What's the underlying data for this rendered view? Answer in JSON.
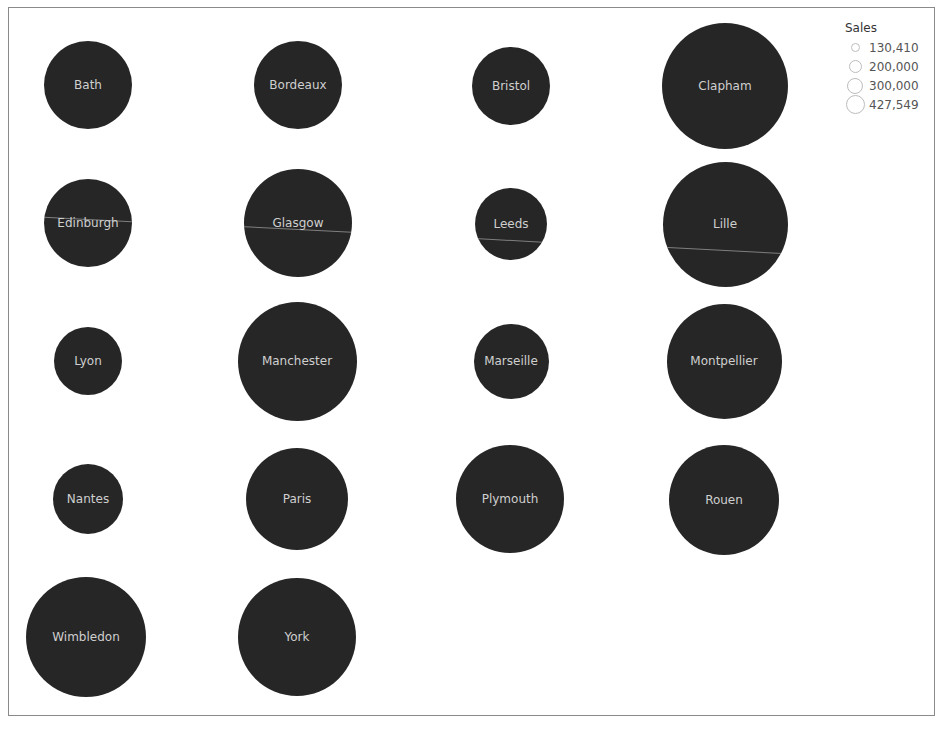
{
  "chart_data": {
    "type": "scatter",
    "subtype": "packed-bubbles-grid",
    "title": "",
    "xlabel": "",
    "ylabel": "",
    "grid": false,
    "legend_position": "top-right",
    "size_measure": "Sales",
    "fill_color": "#262626",
    "label_color": "#cfcfcf",
    "legend": {
      "title": "Sales",
      "entries": [
        "130,410",
        "200,000",
        "300,000",
        "427,549"
      ]
    },
    "categories": [
      "Bath",
      "Bordeaux",
      "Bristol",
      "Clapham",
      "Edinburgh",
      "Glasgow",
      "Leeds",
      "Lille",
      "Lyon",
      "Manchester",
      "Marseille",
      "Montpellier",
      "Nantes",
      "Paris",
      "Plymouth",
      "Rouen",
      "Wimbledon",
      "York"
    ],
    "values": [
      212000,
      212000,
      163000,
      427549,
      207000,
      313000,
      138000,
      421000,
      130410,
      387000,
      150000,
      356000,
      134000,
      279000,
      319000,
      331000,
      387000,
      375000
    ]
  },
  "bubbles": [
    {
      "label": "Bath",
      "cx": 88,
      "cy": 85,
      "d": 88,
      "line": null
    },
    {
      "label": "Bordeaux",
      "cx": 298,
      "cy": 85,
      "d": 88,
      "line": null
    },
    {
      "label": "Bristol",
      "cx": 511,
      "cy": 86,
      "d": 78,
      "line": null
    },
    {
      "label": "Clapham",
      "cx": 725,
      "cy": 86,
      "d": 126,
      "line": null
    },
    {
      "label": "Edinburgh",
      "cx": 88,
      "cy": 223,
      "d": 88,
      "line": 40
    },
    {
      "label": "Glasgow",
      "cx": 298,
      "cy": 223,
      "d": 108,
      "line": 60
    },
    {
      "label": "Leeds",
      "cx": 511,
      "cy": 224,
      "d": 72,
      "line": 52
    },
    {
      "label": "Lille",
      "cx": 725,
      "cy": 224,
      "d": 125,
      "line": 88
    },
    {
      "label": "Lyon",
      "cx": 88,
      "cy": 361,
      "d": 68,
      "line": null
    },
    {
      "label": "Manchester",
      "cx": 297,
      "cy": 361,
      "d": 119,
      "line": null
    },
    {
      "label": "Marseille",
      "cx": 511,
      "cy": 361,
      "d": 75,
      "line": null
    },
    {
      "label": "Montpellier",
      "cx": 724,
      "cy": 361,
      "d": 115,
      "line": null
    },
    {
      "label": "Nantes",
      "cx": 88,
      "cy": 499,
      "d": 70,
      "line": null
    },
    {
      "label": "Paris",
      "cx": 297,
      "cy": 499,
      "d": 102,
      "line": null
    },
    {
      "label": "Plymouth",
      "cx": 510,
      "cy": 499,
      "d": 108,
      "line": null
    },
    {
      "label": "Rouen",
      "cx": 724,
      "cy": 500,
      "d": 110,
      "line": null
    },
    {
      "label": "Wimbledon",
      "cx": 86,
      "cy": 637,
      "d": 120,
      "line": null
    },
    {
      "label": "York",
      "cx": 297,
      "cy": 637,
      "d": 118,
      "line": null
    }
  ],
  "legend": {
    "title": "Sales",
    "items": [
      {
        "label": "130,410",
        "d": 9
      },
      {
        "label": "200,000",
        "d": 13
      },
      {
        "label": "300,000",
        "d": 16
      },
      {
        "label": "427,549",
        "d": 19
      }
    ]
  }
}
